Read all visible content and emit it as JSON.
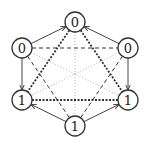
{
  "diagram": {
    "type": "graph",
    "nodes": [
      {
        "id": "top",
        "label": "0",
        "x": 75,
        "y": 22
      },
      {
        "id": "upper-left",
        "label": "0",
        "x": 22,
        "y": 48
      },
      {
        "id": "upper-right",
        "label": "0",
        "x": 128,
        "y": 48
      },
      {
        "id": "lower-left",
        "label": "1",
        "x": 22,
        "y": 100
      },
      {
        "id": "lower-right",
        "label": "1",
        "x": 128,
        "y": 100
      },
      {
        "id": "bottom",
        "label": "1",
        "x": 75,
        "y": 126
      }
    ],
    "edges": [
      {
        "from": "upper-left",
        "to": "top",
        "style": "solid-arrow"
      },
      {
        "from": "upper-right",
        "to": "top",
        "style": "solid-arrow"
      },
      {
        "from": "upper-left",
        "to": "lower-left",
        "style": "solid-arrow"
      },
      {
        "from": "upper-right",
        "to": "lower-right",
        "style": "solid-arrow"
      },
      {
        "from": "bottom",
        "to": "lower-left",
        "style": "solid-arrow"
      },
      {
        "from": "bottom",
        "to": "lower-right",
        "style": "solid-arrow"
      },
      {
        "from": "top",
        "to": "lower-left",
        "style": "thick-dotted"
      },
      {
        "from": "top",
        "to": "lower-right",
        "style": "thick-dotted"
      },
      {
        "from": "lower-left",
        "to": "lower-right",
        "style": "thick-dotted"
      },
      {
        "from": "upper-left",
        "to": "upper-right",
        "style": "dashed"
      },
      {
        "from": "upper-left",
        "to": "bottom",
        "style": "dashed"
      },
      {
        "from": "upper-right",
        "to": "bottom",
        "style": "dashed"
      },
      {
        "from": "top",
        "to": "bottom",
        "style": "light-dotted"
      },
      {
        "from": "upper-left",
        "to": "lower-right",
        "style": "light-dotted"
      },
      {
        "from": "upper-right",
        "to": "lower-left",
        "style": "light-dotted"
      }
    ],
    "colors": {
      "stroke": "#333333",
      "light": "#999999",
      "background": "#ffffff"
    }
  }
}
